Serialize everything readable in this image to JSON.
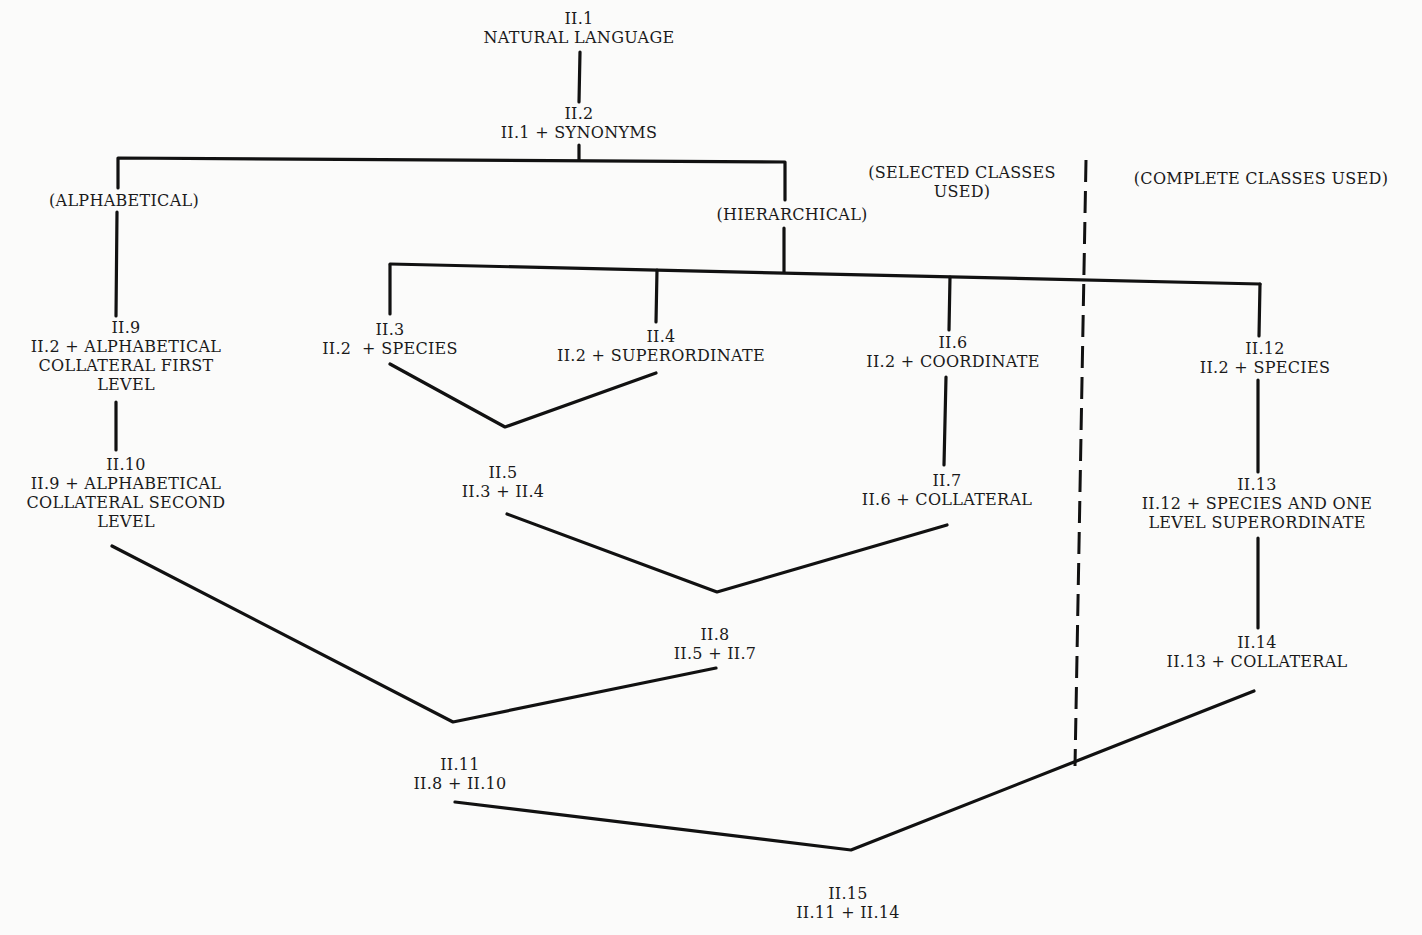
{
  "nodes": {
    "n1": {
      "id": "II.1",
      "lines": [
        "NATURAL LANGUAGE"
      ]
    },
    "n2": {
      "id": "II.2",
      "lines": [
        "II.1 + SYNONYMS"
      ]
    },
    "n3": {
      "id": "II.3",
      "lines": [
        "II.2  + SPECIES"
      ]
    },
    "n4": {
      "id": "II.4",
      "lines": [
        "II.2 + SUPERORDINATE"
      ]
    },
    "n5": {
      "id": "II.5",
      "lines": [
        "II.3 + II.4"
      ]
    },
    "n6": {
      "id": "II.6",
      "lines": [
        "II.2 + COORDINATE"
      ]
    },
    "n7": {
      "id": "II.7",
      "lines": [
        "II.6 + COLLATERAL"
      ]
    },
    "n8": {
      "id": "II.8",
      "lines": [
        "II.5 + II.7"
      ]
    },
    "n9": {
      "id": "II.9",
      "lines": [
        "II.2 + ALPHABETICAL",
        "COLLATERAL FIRST",
        "LEVEL"
      ]
    },
    "n10": {
      "id": "II.10",
      "lines": [
        "II.9 + ALPHABETICAL",
        "COLLATERAL SECOND",
        "LEVEL"
      ]
    },
    "n11": {
      "id": "II.11",
      "lines": [
        "II.8 + II.10"
      ]
    },
    "n12": {
      "id": "II.12",
      "lines": [
        "II.2 + SPECIES"
      ]
    },
    "n13": {
      "id": "II.13",
      "lines": [
        "II.12 + SPECIES AND ONE",
        "LEVEL SUPERORDINATE"
      ]
    },
    "n14": {
      "id": "II.14",
      "lines": [
        "II.13 + COLLATERAL"
      ]
    },
    "n15": {
      "id": "II.15",
      "lines": [
        "II.11 + II.14"
      ]
    }
  },
  "branches": {
    "alphabetical": "(ALPHABETICAL)",
    "hierarchical": "(HIERARCHICAL)"
  },
  "regions": {
    "selected": [
      "(SELECTED CLASSES",
      "USED)"
    ],
    "complete": "(COMPLETE CLASSES USED)"
  },
  "style": {
    "line_color": "#111111",
    "background": "#fbfbfa"
  }
}
